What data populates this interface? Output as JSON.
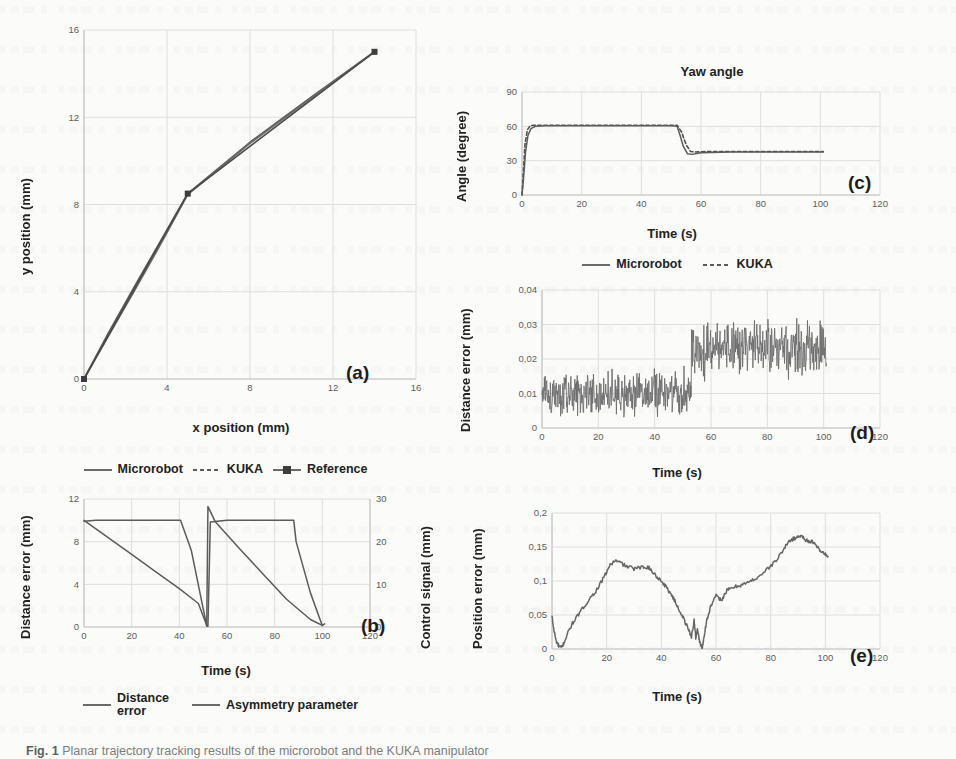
{
  "figure": {
    "caption_bold": "Fig. 1",
    "caption_text": "Planar trajectory tracking results of the microrobot and the KUKA manipulator"
  },
  "colors": {
    "line": "#5b5b5b",
    "line_dark": "#4a4a4a",
    "grid": "#dedede",
    "axis": "#c6c6c6",
    "text": "#222222",
    "tick": "#5d5d5d"
  },
  "panels": {
    "a": {
      "tag": "(a)",
      "xlabel": "x position (mm)",
      "ylabel": "y position (mm)",
      "legend": [
        {
          "label": "Microrobot",
          "style": "solid"
        },
        {
          "label": "KUKA",
          "style": "dashed"
        },
        {
          "label": "Reference",
          "style": "marker"
        }
      ]
    },
    "b": {
      "tag": "(b)",
      "xlabel": "Time (s)",
      "ylabel": "Distance error (mm)",
      "ylabel_right": "Control signal (mm)",
      "legend": [
        {
          "label": "Distance\nerror",
          "style": "solid"
        },
        {
          "label": "Asymmetry parameter",
          "style": "solid"
        }
      ]
    },
    "c": {
      "tag": "(c)",
      "title": "Yaw angle",
      "xlabel": "Time (s)",
      "ylabel": "Angle (degree)",
      "legend": [
        {
          "label": "Microrobot",
          "style": "solid"
        },
        {
          "label": "KUKA",
          "style": "dashed"
        }
      ]
    },
    "d": {
      "tag": "(d)",
      "xlabel": "Time (s)",
      "ylabel": "Distance error (mm)"
    },
    "e": {
      "tag": "(e)",
      "xlabel": "Time (s)",
      "ylabel": "Position error (mm)"
    }
  },
  "chart_data": [
    {
      "id": "a",
      "type": "line",
      "title": "",
      "xlabel": "x position (mm)",
      "ylabel": "y position (mm)",
      "xlim": [
        0,
        16
      ],
      "ylim": [
        0,
        16
      ],
      "xticks": [
        0,
        4,
        8,
        12,
        16
      ],
      "yticks": [
        0,
        4,
        8,
        12,
        16
      ],
      "grid": true,
      "legend_position": "below",
      "series": [
        {
          "name": "Reference",
          "style": "solid-marker",
          "x": [
            0,
            5,
            14
          ],
          "y": [
            0,
            8.5,
            15
          ]
        },
        {
          "name": "Microrobot",
          "style": "solid",
          "x": [
            0,
            1.2,
            2.5,
            3.8,
            5,
            8,
            11,
            14
          ],
          "y": [
            0,
            2.15,
            4.35,
            6.5,
            8.5,
            10.85,
            12.95,
            15
          ]
        },
        {
          "name": "KUKA",
          "style": "dashed",
          "x": [
            0,
            1.2,
            2.5,
            3.8,
            5,
            8,
            11,
            14
          ],
          "y": [
            0,
            2.0,
            4.15,
            6.35,
            8.45,
            10.8,
            12.9,
            15
          ]
        }
      ]
    },
    {
      "id": "b",
      "type": "line",
      "title": "",
      "xlabel": "Time (s)",
      "ylabel": "Distance error (mm)",
      "ylabel_right": "Control signal (mm)",
      "xlim": [
        0,
        120
      ],
      "ylim": [
        0,
        12
      ],
      "ylim_right": [
        0,
        30
      ],
      "xticks": [
        0,
        20,
        40,
        60,
        80,
        100,
        120
      ],
      "yticks": [
        0,
        4,
        8,
        12
      ],
      "yticks_right": [
        0,
        10,
        20,
        30
      ],
      "grid": true,
      "legend_position": "below",
      "series": [
        {
          "name": "Distance error",
          "axis": "left",
          "style": "solid",
          "x": [
            0,
            10,
            20,
            30,
            40,
            48,
            51.5,
            52,
            55,
            65,
            75,
            85,
            95,
            100,
            101
          ],
          "y": [
            10.0,
            8.4,
            6.8,
            5.2,
            3.6,
            2.2,
            0.15,
            11.3,
            9.9,
            7.4,
            5.0,
            2.6,
            0.7,
            0.15,
            0.3
          ]
        },
        {
          "name": "Asymmetry parameter",
          "axis": "right",
          "style": "solid",
          "x": [
            0,
            5,
            20,
            40,
            40.5,
            45,
            51.5,
            52,
            53,
            60,
            80,
            88,
            89,
            95,
            100
          ],
          "y": [
            24.8,
            25.0,
            25.0,
            25.0,
            25.0,
            18.0,
            0.2,
            0.2,
            24.6,
            25.0,
            25.0,
            25.0,
            20.0,
            8.0,
            0.3
          ]
        }
      ]
    },
    {
      "id": "c",
      "type": "line",
      "title": "Yaw angle",
      "xlabel": "Time (s)",
      "ylabel": "Angle (degree)",
      "xlim": [
        0,
        120
      ],
      "ylim": [
        0,
        90
      ],
      "xticks": [
        0,
        20,
        40,
        60,
        80,
        100,
        120
      ],
      "yticks": [
        0,
        30,
        60,
        90
      ],
      "grid": true,
      "legend_position": "below",
      "series": [
        {
          "name": "Microrobot",
          "style": "solid",
          "x": [
            0,
            0.5,
            1.2,
            2.0,
            3.0,
            4.5,
            8,
            20,
            40,
            50,
            52,
            53,
            54,
            55.5,
            57,
            60,
            70,
            85,
            101
          ],
          "y": [
            0,
            14,
            38,
            52,
            58,
            60,
            60.5,
            60.5,
            60.5,
            60.5,
            60,
            52,
            43,
            36,
            35.5,
            37,
            37.5,
            37.5,
            37.5
          ]
        },
        {
          "name": "KUKA",
          "style": "dashed",
          "x": [
            0,
            0.4,
            1.0,
            1.8,
            2.8,
            4.0,
            8,
            20,
            40,
            50,
            52,
            53.5,
            55,
            56.5,
            58,
            62,
            75,
            90,
            101
          ],
          "y": [
            0,
            18,
            44,
            57,
            60.5,
            61,
            61,
            61,
            61,
            61,
            61,
            55,
            44,
            38,
            37.5,
            38,
            38,
            38,
            38
          ]
        }
      ]
    },
    {
      "id": "d",
      "type": "line",
      "title": "",
      "xlabel": "Time (s)",
      "ylabel": "Distance error (mm)",
      "xlim": [
        0,
        120
      ],
      "ylim": [
        0,
        0.04
      ],
      "xticks": [
        0,
        20,
        40,
        60,
        80,
        100,
        120
      ],
      "yticks": [
        0,
        0.01,
        0.02,
        0.03,
        0.04
      ],
      "ytick_labels": [
        "0",
        "0,01",
        "0,02",
        "0,03",
        "0,04"
      ],
      "grid": true,
      "description": "Dense noisy signal: mean ~0.010 mm for t<53 s (band 0.000-0.021), mean ~0.023 mm for t>54 s (band 0.012-0.038)",
      "noise": {
        "segments": [
          {
            "t_start": 0,
            "t_end": 53,
            "mean": 0.01,
            "amplitude": 0.0095
          },
          {
            "t_start": 53,
            "t_end": 101,
            "mean": 0.0235,
            "amplitude": 0.011
          }
        ],
        "samples": 720
      },
      "series": [
        {
          "name": "Distance error",
          "style": "solid"
        }
      ]
    },
    {
      "id": "e",
      "type": "line",
      "title": "",
      "xlabel": "Time (s)",
      "ylabel": "Position error (mm)",
      "xlim": [
        0,
        120
      ],
      "ylim": [
        0,
        0.2
      ],
      "xticks": [
        0,
        20,
        40,
        60,
        80,
        100,
        120
      ],
      "yticks": [
        0,
        0.05,
        0.1,
        0.15,
        0.2
      ],
      "ytick_labels": [
        "0",
        "0,05",
        "0,1",
        "0,15",
        "0,2"
      ],
      "grid": true,
      "series": [
        {
          "name": "Position error",
          "style": "solid",
          "x": [
            0,
            0.6,
            1.5,
            2.5,
            3.5,
            4.5,
            6,
            8,
            10,
            13,
            16,
            19,
            21,
            23,
            25,
            27,
            30,
            33,
            35,
            36,
            38,
            40,
            42,
            44,
            46,
            48,
            50,
            51,
            52,
            52.6,
            53.2,
            54,
            55,
            55.6,
            56.5,
            58,
            60,
            62,
            64,
            66,
            68,
            70,
            73,
            76,
            79,
            82,
            85,
            87,
            89,
            91,
            93,
            95,
            97,
            99,
            101
          ],
          "y": [
            0.048,
            0.03,
            0.012,
            0.004,
            0.002,
            0.01,
            0.026,
            0.041,
            0.052,
            0.07,
            0.085,
            0.105,
            0.122,
            0.13,
            0.127,
            0.122,
            0.118,
            0.12,
            0.121,
            0.117,
            0.108,
            0.1,
            0.09,
            0.078,
            0.062,
            0.046,
            0.028,
            0.018,
            0.042,
            0.016,
            0.03,
            0.01,
            0.002,
            0.018,
            0.04,
            0.062,
            0.078,
            0.072,
            0.086,
            0.09,
            0.093,
            0.095,
            0.1,
            0.108,
            0.118,
            0.13,
            0.148,
            0.16,
            0.163,
            0.167,
            0.16,
            0.158,
            0.15,
            0.142,
            0.136
          ]
        }
      ]
    }
  ]
}
